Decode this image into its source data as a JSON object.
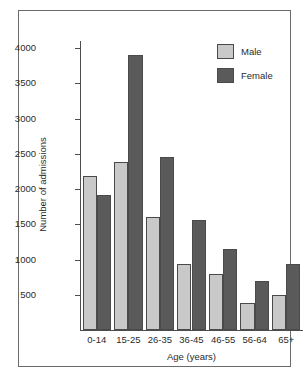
{
  "chart_data": {
    "type": "bar",
    "title": "",
    "xlabel": "Age (years)",
    "ylabel": "Number of admissions",
    "categories": [
      "0-14",
      "15-25",
      "26-35",
      "36-45",
      "46-55",
      "56-64",
      "65+"
    ],
    "series": [
      {
        "name": "Male",
        "color": "#c9c9c9",
        "values": [
          2180,
          2390,
          1610,
          940,
          800,
          390,
          490
        ]
      },
      {
        "name": "Female",
        "color": "#5a5a5a",
        "values": [
          1920,
          3900,
          2450,
          1560,
          1150,
          690,
          930
        ]
      }
    ],
    "ylim": [
      0,
      4100
    ],
    "ytick_values": [
      500,
      1000,
      1500,
      2000,
      2500,
      3000,
      3500,
      4000
    ],
    "ytick_labels": [
      "500",
      "1000",
      "1500",
      "2000",
      "2500",
      "3000",
      "3500",
      "4000"
    ],
    "grid": false,
    "legend_position": "top-right",
    "legend_entries": [
      "Male",
      "Female"
    ]
  },
  "figure": {
    "frame_color": "#6b6b6b",
    "background": "#ffffff",
    "axis_color": "#4d4d4d"
  }
}
